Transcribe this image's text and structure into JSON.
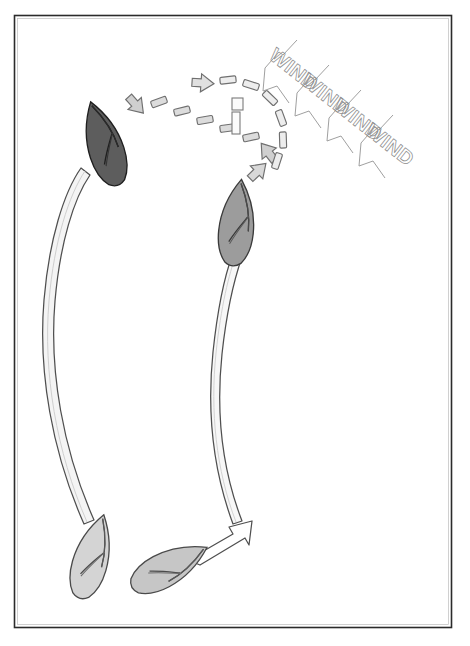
{
  "figure": {
    "background_color": "#ffffff",
    "frame": {
      "name": "page-border",
      "color": "#2b2b2b",
      "x": 14,
      "y": 15,
      "width": 438,
      "height": 613
    }
  },
  "wind": {
    "label": "WIND",
    "repeat_count": 4,
    "text_color": "#7d7d7d",
    "arrow_color": "#8a8a8a",
    "direction_degrees": 38,
    "arrows": [
      {
        "label": "WIND",
        "x": 268,
        "y": 55,
        "rotation": 38
      },
      {
        "label": "WIND",
        "x": 300,
        "y": 80,
        "rotation": 38
      },
      {
        "label": "WIND",
        "x": 332,
        "y": 105,
        "rotation": 38
      },
      {
        "label": "WIND",
        "x": 364,
        "y": 130,
        "rotation": 38
      }
    ]
  },
  "boats": [
    {
      "id": "boat-start-port",
      "name": "boat-bottom-left",
      "label": "",
      "hull_color": "#d4d4d4",
      "outline_color": "#4a4a4a",
      "cx": 92,
      "cy": 556,
      "rotation": 16,
      "stage": "start"
    },
    {
      "id": "boat-start-starboard",
      "name": "boat-bottom-right",
      "label": "",
      "hull_color": "#bfbfbf",
      "outline_color": "#4a4a4a",
      "cx": 168,
      "cy": 566,
      "rotation": 62,
      "stage": "start"
    },
    {
      "id": "boat-mid",
      "name": "boat-middle",
      "label": "",
      "hull_color": "#9a9a9a",
      "outline_color": "#3a3a3a",
      "cx": 237,
      "cy": 222,
      "rotation": 6,
      "stage": "turning"
    },
    {
      "id": "boat-end",
      "name": "boat-top-left",
      "label": "",
      "hull_color": "#5d5d5d",
      "outline_color": "#222222",
      "cx": 104,
      "cy": 143,
      "rotation": -18,
      "stage": "finish"
    }
  ],
  "tracks": [
    {
      "id": "track-left",
      "name": "wake-track-left",
      "color": "#f2f2f2",
      "outline_color": "#4f4f4f",
      "from": "boat-bottom-left",
      "to": "boat-top-left"
    },
    {
      "id": "track-right",
      "name": "wake-track-right",
      "color": "#f6f6f6",
      "outline_color": "#4f4f4f",
      "from": "boat-bottom-right",
      "to": "boat-middle"
    }
  ],
  "arrows": {
    "course_arrow": {
      "name": "course-arrow-bottom",
      "color": "#ffffff",
      "outline_color": "#4f4f4f",
      "points_to": "up-right"
    },
    "tack_path": {
      "name": "dashed-tack-path",
      "style": "dashed",
      "dash_color": "#d0d0d0",
      "dash_outline": "#6a6a6a",
      "head_color": "#c9c9c9",
      "head_direction": "up-left",
      "segments": 7
    },
    "turn_arc": {
      "name": "dashed-turn-arc",
      "style": "dashed",
      "dash_color": "#e8e8e8",
      "dash_outline": "#6a6a6a",
      "head_count": 2,
      "head_directions": [
        "left",
        "down-left"
      ],
      "segments": 10
    }
  },
  "center_marker": {
    "name": "wind-center-marker",
    "color": "#fbfbfb",
    "outline_color": "#7a7a7a",
    "x": 236,
    "y": 104
  }
}
